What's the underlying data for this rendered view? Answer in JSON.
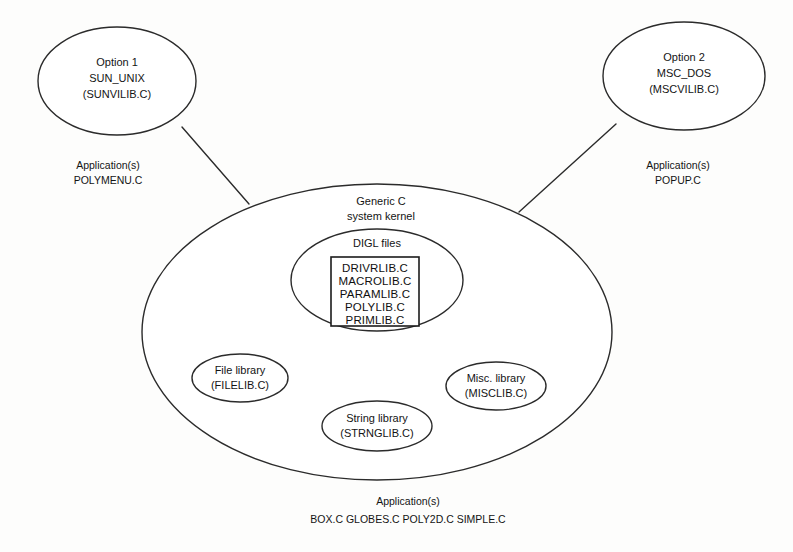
{
  "diagram": {
    "colors": {
      "stroke": "#2b2b2b",
      "background": "#fdfdfc",
      "text": "#141414"
    },
    "options": [
      {
        "id": "option-1",
        "line1": "Option 1",
        "line2": "SUN_UNIX",
        "line3": "(SUNVILIB.C)",
        "caption_line1": "Application(s)",
        "caption_line2": "POLYMENU.C"
      },
      {
        "id": "option-2",
        "line1": "Option 2",
        "line2": "MSC_DOS",
        "line3": "(MSCVILIB.C)",
        "caption_line1": "Application(s)",
        "caption_line2": "POPUP.C"
      }
    ],
    "kernel": {
      "line1": "Generic C",
      "line2": "system kernel"
    },
    "digl": {
      "label": "DIGL files",
      "files": [
        "DRIVRLIB.C",
        "MACROLIB.C",
        "PARAMLIB.C",
        "POLYLIB.C",
        "PRIMLIB.C"
      ]
    },
    "libraries": [
      {
        "id": "file-library",
        "line1": "File library",
        "line2": "(FILELIB.C)"
      },
      {
        "id": "string-library",
        "line1": "String library",
        "line2": "(STRNGLIB.C)"
      },
      {
        "id": "misc-library",
        "line1": "Misc. library",
        "line2": "(MISCLIB.C)"
      }
    ],
    "bottom_caption": {
      "line1": "Application(s)",
      "line2": "BOX.C   GLOBES.C   POLY2D.C   SIMPLE.C"
    }
  }
}
